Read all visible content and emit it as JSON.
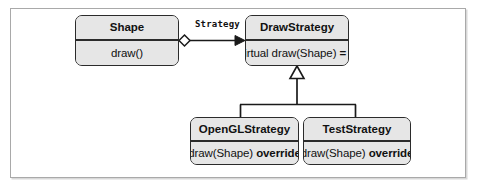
{
  "diagram": {
    "type": "uml-class-diagram",
    "classes": [
      {
        "id": "shape",
        "name": "Shape",
        "members": [
          "draw()"
        ]
      },
      {
        "id": "drawstrategy",
        "name": "DrawStrategy",
        "members": [
          "virtual draw(Shape) = 0"
        ],
        "member_parts": {
          "prefix": "virtual draw(Shape) ",
          "suffix": "= 0"
        }
      },
      {
        "id": "openglstrategy",
        "name": "OpenGLStrategy",
        "members": [
          "draw(Shape) override"
        ],
        "member_parts": {
          "prefix": "draw(Shape) ",
          "suffix": "override"
        }
      },
      {
        "id": "teststrategy",
        "name": "TestStrategy",
        "members": [
          "draw(Shape) override"
        ],
        "member_parts": {
          "prefix": "draw(Shape) ",
          "suffix": "override"
        }
      }
    ],
    "relationships": [
      {
        "id": "shape-drawstrategy",
        "kind": "aggregation-directed",
        "from": "Shape",
        "to": "DrawStrategy",
        "label": "Strategy",
        "source_decoration": "hollow-diamond",
        "target_decoration": "solid-arrowhead"
      },
      {
        "id": "openglstrategy-drawstrategy",
        "kind": "generalization",
        "from": "OpenGLStrategy",
        "to": "DrawStrategy",
        "label": "",
        "target_decoration": "hollow-triangle"
      },
      {
        "id": "teststrategy-drawstrategy",
        "kind": "generalization",
        "from": "TestStrategy",
        "to": "DrawStrategy",
        "label": "",
        "target_decoration": "hollow-triangle"
      }
    ]
  },
  "colors": {
    "box_fill": "#e6e6e6",
    "box_border": "#2b2b2b",
    "line": "#1a1a1a",
    "frame_border": "#a9a9a9",
    "page_background": "#ffffff",
    "text": "#111111"
  }
}
